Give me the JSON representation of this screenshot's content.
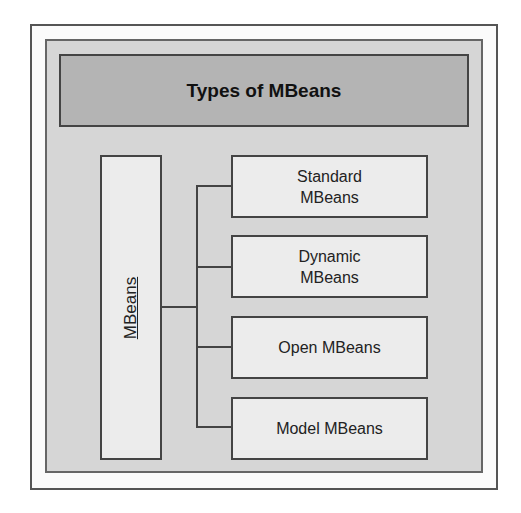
{
  "diagram": {
    "title": "Types of MBeans",
    "root": {
      "label": "MBeans"
    },
    "children": [
      {
        "label": "Standard MBeans"
      },
      {
        "label": "Dynamic MBeans"
      },
      {
        "label": "Open MBeans"
      },
      {
        "label": "Model MBeans"
      }
    ],
    "colors": {
      "outer_background": "#fbfbfb",
      "panel_background": "#d6d6d6",
      "title_background": "#b4b4b4",
      "box_background": "#ececec",
      "border": "#444444"
    }
  }
}
